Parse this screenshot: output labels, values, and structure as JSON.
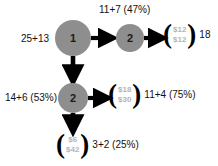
{
  "diagram": {
    "type": "decision-tree",
    "background_color": "#ffffff",
    "node_color": "#8e8e8e",
    "leaf_value_color": "#b4b4b4",
    "text_color": "#111111",
    "nodes": [
      {
        "id": "root",
        "label": "1",
        "x": 73,
        "y": 38,
        "r": 18
      },
      {
        "id": "top_right",
        "label": "2",
        "x": 130,
        "y": 38,
        "r": 14
      },
      {
        "id": "middle",
        "label": "2",
        "x": 73,
        "y": 98,
        "r": 15
      }
    ],
    "labels": [
      {
        "id": "root_left",
        "text": "25+13",
        "x": 21,
        "y": 34
      },
      {
        "id": "top_branch",
        "text": "11+7 (47%)",
        "x": 99,
        "y": 5
      },
      {
        "id": "middle_left",
        "text": "14+6 (53%)",
        "x": 5,
        "y": 93
      }
    ],
    "leaves": [
      {
        "id": "leaf_top",
        "values": [
          "$12",
          "$12"
        ],
        "after": "18",
        "x": 163,
        "y": 24
      },
      {
        "id": "leaf_middle",
        "values": [
          "$18",
          "$30"
        ],
        "after": "11+4 (75%)",
        "x": 108,
        "y": 84
      },
      {
        "id": "leaf_bottom",
        "values": [
          "$6",
          "$42"
        ],
        "after": "3+2 (25%)",
        "x": 56,
        "y": 134
      }
    ]
  }
}
